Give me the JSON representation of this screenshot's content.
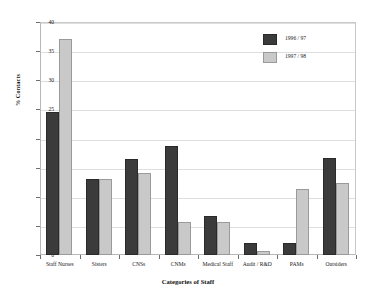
{
  "chart_data": {
    "type": "bar",
    "title": "",
    "xlabel": "Categories of Staff",
    "ylabel": "% Contacts",
    "ylim": [
      0,
      40
    ],
    "ytick_values": [
      0,
      5,
      10,
      15,
      20,
      25,
      30,
      35,
      40
    ],
    "ytick_labels": [
      "0",
      "5",
      "10",
      "15",
      "20",
      "25",
      "30",
      "35",
      "40"
    ],
    "grid": true,
    "legend_position": "top-right",
    "categories": [
      "Staff Nurses",
      "Sisters",
      "CNSs",
      "CNMs",
      "Medical Staff",
      "Audit / R&D",
      "PAMs",
      "Outsiders"
    ],
    "series": [
      {
        "name": "1996 / 97",
        "color": "#3b3b3b",
        "values": [
          24.5,
          13.0,
          16.5,
          18.8,
          6.7,
          2.0,
          2.0,
          16.6
        ]
      },
      {
        "name": "1997 / 98",
        "color": "#c9c9c9",
        "values": [
          37.0,
          13.0,
          14.0,
          5.6,
          5.6,
          0.7,
          11.3,
          12.3
        ]
      }
    ]
  }
}
